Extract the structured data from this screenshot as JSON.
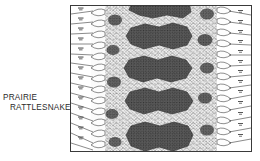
{
  "plate": {
    "caption": {
      "line1": "PRAIRIE",
      "line2": "RATTLESNAKE"
    },
    "panel": {
      "title": "dorsal scale pattern illustration",
      "border_color": "#3a3a3a",
      "background_color": "#ffffff",
      "ink_color": "#1a1a1a",
      "blotch_color": "#262626",
      "midtone_color": "#777777"
    },
    "illustration": {
      "subject": "prairie rattlesnake dorsal surface",
      "dorsal_blotch_count": 5,
      "lateral_blotch_count": 8,
      "leader_lines_left": 14,
      "leader_lines_right": 13,
      "technique": "pen-and-ink stipple"
    }
  }
}
